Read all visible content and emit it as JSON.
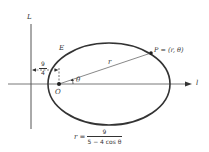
{
  "diagram": {
    "type": "polar-ellipse-directrix",
    "labels": {
      "directrix": "L",
      "polar_axis": "l",
      "point_E": "E",
      "point_P": "P = (r, θ)",
      "origin": "O",
      "radius": "r",
      "angle": "θ"
    },
    "distance_label": {
      "numerator": "9",
      "denominator": "4"
    },
    "equation": {
      "lhs": "r =",
      "numerator": "9",
      "denominator": "5 − 4 cos θ"
    },
    "colors": {
      "stroke": "#333333",
      "axis": "#555555",
      "background": "#ffffff"
    }
  }
}
